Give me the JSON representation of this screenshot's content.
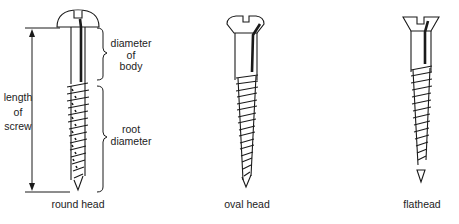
{
  "diagram": {
    "type": "screw-types-illustration",
    "screws": [
      {
        "id": "round-head",
        "label": "round head"
      },
      {
        "id": "oval-head",
        "label": "oval head"
      },
      {
        "id": "flathead",
        "label": "flathead"
      }
    ],
    "annotations": {
      "length": [
        "length",
        "of",
        "screw"
      ],
      "body_diameter": [
        "diameter",
        "of",
        "body"
      ],
      "root_diameter": [
        "root",
        "diameter"
      ]
    },
    "colors": {
      "line": "#1a1a1a",
      "background": "#ffffff"
    }
  }
}
